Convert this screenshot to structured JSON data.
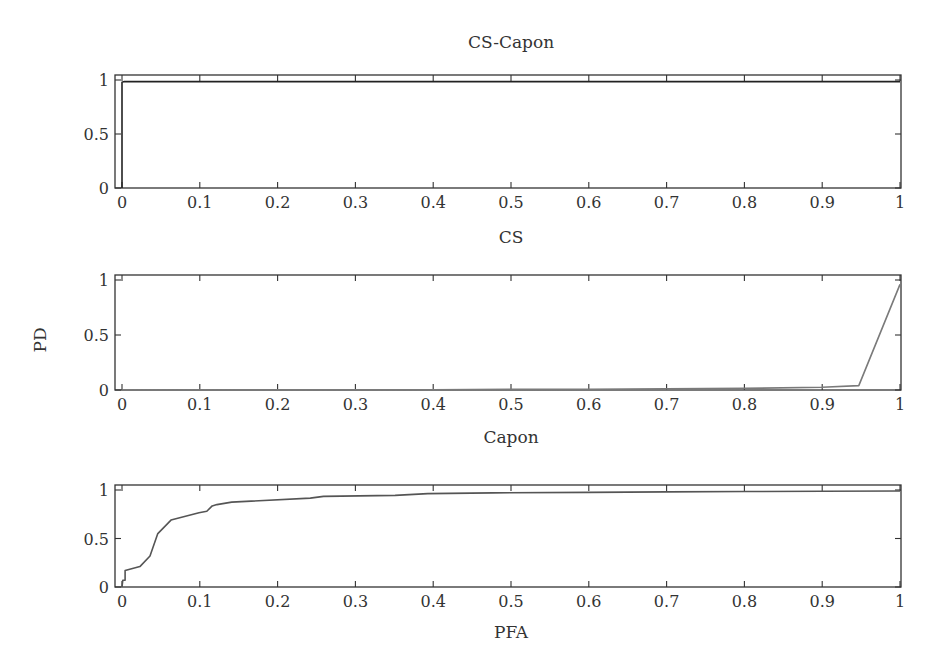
{
  "figure": {
    "ylabel": "PD",
    "xlabel": "PFA"
  },
  "chart_data": [
    {
      "type": "line",
      "title": "CS-Capon",
      "xlabel": "",
      "ylabel": "",
      "xlim": [
        0,
        1
      ],
      "ylim": [
        0,
        1
      ],
      "x_ticks": [
        0,
        0.1,
        0.2,
        0.3,
        0.4,
        0.5,
        0.6,
        0.7,
        0.8,
        0.9,
        1
      ],
      "x_tick_labels": [
        "0",
        "0.1",
        "0.2",
        "0.3",
        "0.4",
        "0.5",
        "0.6",
        "0.7",
        "0.8",
        "0.9",
        "1"
      ],
      "y_ticks": [
        0,
        0.5,
        1
      ],
      "y_tick_labels": [
        "0",
        "0.5",
        "1"
      ],
      "grid": false,
      "series": [
        {
          "name": "CS-Capon",
          "color": "#222222",
          "x": [
            0,
            0.0,
            0.003,
            0.5,
            1.0
          ],
          "y": [
            0,
            0.98,
            0.985,
            0.985,
            0.985
          ]
        }
      ]
    },
    {
      "type": "line",
      "title": "CS",
      "xlabel": "",
      "ylabel": "PD",
      "xlim": [
        0,
        1
      ],
      "ylim": [
        0,
        1
      ],
      "x_ticks": [
        0,
        0.1,
        0.2,
        0.3,
        0.4,
        0.5,
        0.6,
        0.7,
        0.8,
        0.9,
        1
      ],
      "x_tick_labels": [
        "0",
        "0.1",
        "0.2",
        "0.3",
        "0.4",
        "0.5",
        "0.6",
        "0.7",
        "0.8",
        "0.9",
        "1"
      ],
      "y_ticks": [
        0,
        0.5,
        1
      ],
      "y_tick_labels": [
        "0",
        "0.5",
        "1"
      ],
      "grid": false,
      "series": [
        {
          "name": "CS",
          "color": "#7a7a7a",
          "x": [
            0,
            0.4,
            0.5,
            0.6,
            0.7,
            0.8,
            0.9,
            0.947,
            1.0
          ],
          "y": [
            0,
            0.003,
            0.005,
            0.007,
            0.01,
            0.015,
            0.025,
            0.04,
            0.96
          ]
        }
      ]
    },
    {
      "type": "line",
      "title": "Capon",
      "xlabel": "PFA",
      "ylabel": "",
      "xlim": [
        0,
        1
      ],
      "ylim": [
        0,
        1
      ],
      "x_ticks": [
        0,
        0.1,
        0.2,
        0.3,
        0.4,
        0.5,
        0.6,
        0.7,
        0.8,
        0.9,
        1
      ],
      "x_tick_labels": [
        "0",
        "0.1",
        "0.2",
        "0.3",
        "0.4",
        "0.5",
        "0.6",
        "0.7",
        "0.8",
        "0.9",
        "1"
      ],
      "y_ticks": [
        0,
        0.5,
        1
      ],
      "y_tick_labels": [
        "0",
        "0.5",
        "1"
      ],
      "grid": false,
      "series": [
        {
          "name": "Capon",
          "color": "#555555",
          "x": [
            0,
            0.001,
            0.004,
            0.004,
            0.023,
            0.036,
            0.046,
            0.063,
            0.099,
            0.109,
            0.116,
            0.122,
            0.141,
            0.242,
            0.259,
            0.351,
            0.393,
            0.477,
            0.6,
            0.7,
            0.8,
            0.9,
            1.0
          ],
          "y": [
            0,
            0.07,
            0.07,
            0.17,
            0.21,
            0.32,
            0.55,
            0.69,
            0.765,
            0.78,
            0.836,
            0.85,
            0.875,
            0.917,
            0.934,
            0.944,
            0.963,
            0.97,
            0.975,
            0.98,
            0.985,
            0.987,
            0.99
          ]
        }
      ]
    }
  ]
}
